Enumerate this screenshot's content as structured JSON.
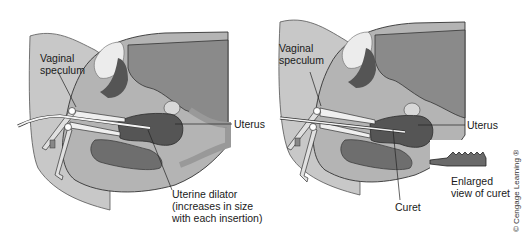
{
  "figure": {
    "panels": [
      {
        "id": "A",
        "labels": {
          "speculum": [
            "Vaginal",
            "speculum"
          ],
          "uterus": "Uterus",
          "instrument": [
            "Uterine dilator",
            "(increases in size",
            "with each insertion)"
          ]
        }
      },
      {
        "id": "B",
        "labels": {
          "speculum": [
            "Vaginal",
            "speculum"
          ],
          "uterus": "Uterus",
          "instrument": "Curet",
          "enlarged": [
            "Enlarged",
            "view of curet"
          ]
        }
      }
    ],
    "copyright": "© Cengage Learning ®",
    "colors": {
      "background": "#ffffff",
      "skin": "#c8c8c8",
      "body_outline": "#3a3a3a",
      "abdomen": "#8a8a8a",
      "uterus": "#555555",
      "bladder_light": "#e6e6e6",
      "rectum": "#6e6e6e",
      "instrument": "#f2f2f2",
      "text": "#1a1a1a"
    }
  }
}
